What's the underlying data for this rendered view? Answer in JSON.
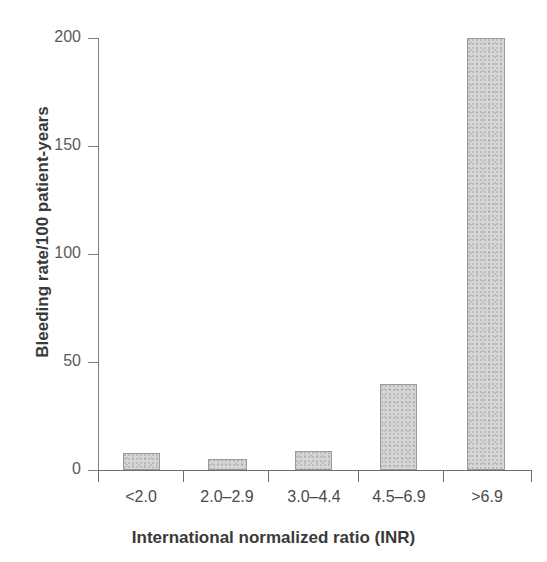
{
  "chart_data": {
    "type": "bar",
    "title": "",
    "xlabel": "International normalized ratio (INR)",
    "ylabel": "Bleeding rate/100 patient-years",
    "categories": [
      "<2.0",
      "2.0–2.9",
      "3.0–4.4",
      "4.5–6.9",
      ">6.9"
    ],
    "values": [
      8,
      5,
      9,
      40,
      200
    ],
    "ylim": [
      0,
      200
    ],
    "yticks": [
      0,
      50,
      100,
      150,
      200
    ],
    "ytick_labels": [
      "0",
      "50",
      "100",
      "150",
      "200"
    ],
    "grid": false,
    "legend": null,
    "bar_color": "#d6d6d6",
    "bar_edge_color": "#9a9a9a",
    "axis_color": "#6e6e6e",
    "text_color": "#3a3a3a"
  }
}
